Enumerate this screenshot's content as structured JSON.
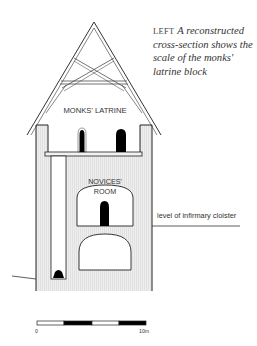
{
  "caption": {
    "lead": "LEFT",
    "body": "A reconstructed cross-section shows the scale of the monks' latrine block"
  },
  "labels": {
    "monks_latrine": "MONKS' LATRINE",
    "novices_room_line1": "NOVICES'",
    "novices_room_line2": "ROOM",
    "cloister_level": "level of infirmary cloister"
  },
  "scale_bar": {
    "start_label": "0",
    "end_label": "10m",
    "segments": [
      "white",
      "black",
      "white",
      "black"
    ]
  },
  "colors": {
    "line": "#222222",
    "wall_fill": "#e6e6e6",
    "text": "#333333",
    "black_fill": "#000000"
  }
}
